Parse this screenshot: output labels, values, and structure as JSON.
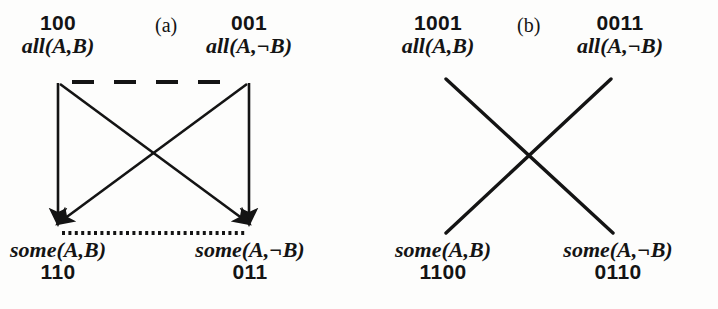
{
  "figure": {
    "background_color": "#fdfdfc",
    "ink_color": "#141414",
    "width": 718,
    "height": 309,
    "panels": [
      {
        "id": "a",
        "label": "(a)",
        "label_x": 155,
        "label_y": 12,
        "edges": {
          "contrariety_style": "dashed",
          "subcontrariety_style": "dotted",
          "subalternation_style": "solid-arrow",
          "contradiction_style": "solid-arrow"
        },
        "nodes": {
          "top_left": {
            "code": "100",
            "formula": "all(A,B)",
            "x": 58,
            "y": 12
          },
          "top_right": {
            "code": "001",
            "formula": "all(A,¬B)",
            "x": 249,
            "y": 12
          },
          "bottom_left": {
            "code": "110",
            "formula": "some(A,B)",
            "x": 58,
            "y": 238
          },
          "bottom_right": {
            "code": "011",
            "formula": "some(A,¬B)",
            "x": 249,
            "y": 238
          }
        }
      },
      {
        "id": "b",
        "label": "(b)",
        "label_x": 517,
        "label_y": 12,
        "edges": {
          "contrariety_style": "none",
          "subcontrariety_style": "none",
          "subalternation_style": "none",
          "contradiction_style": "solid-plain"
        },
        "nodes": {
          "top_left": {
            "code": "1001",
            "formula": "all(A,B)",
            "x": 438,
            "y": 12
          },
          "top_right": {
            "code": "0011",
            "formula": "all(A,¬B)",
            "x": 620,
            "y": 12
          },
          "bottom_left": {
            "code": "1100",
            "formula": "some(A,B)",
            "x": 443,
            "y": 238
          },
          "bottom_right": {
            "code": "0110",
            "formula": "some(A,¬B)",
            "x": 617,
            "y": 238
          }
        }
      }
    ]
  }
}
